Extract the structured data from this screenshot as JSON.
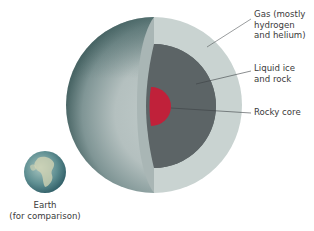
{
  "diagram": {
    "layers": [
      {
        "id": "gas",
        "label": "Gas (mostly\nhydrogen\nand helium)",
        "color": "#c9d3d1"
      },
      {
        "id": "mantle",
        "label": "Liquid ice\nand rock",
        "color": "#5c6466"
      },
      {
        "id": "core",
        "label": "Rocky core",
        "color": "#c0213a"
      }
    ],
    "comparison": {
      "label": "Earth\n(for comparison)"
    },
    "colors": {
      "exterior_dark": "#4f6c6c",
      "exterior_light": "#b8c4c3",
      "cut_edge": "#a9b6b5",
      "leader_line": "#555b5c"
    }
  }
}
